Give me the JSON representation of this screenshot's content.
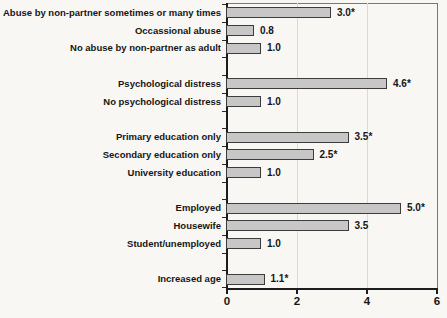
{
  "figure": {
    "kind": "scanned statistical figure",
    "background": "#f8f7f4"
  },
  "chart_data": {
    "type": "bar",
    "orientation": "horizontal",
    "title": "",
    "xlabel": "",
    "ylabel": "",
    "xlim": [
      0,
      6
    ],
    "xticks": [
      0,
      2,
      4,
      6
    ],
    "xtick_labels": [
      "0",
      "2",
      "4",
      "6"
    ],
    "grid": "vertical gridlines at 2 and 4",
    "legend": "none",
    "categories": [
      "Abuse by non-partner sometimes or many times",
      "Occassional abuse",
      "No abuse by non-partner as adult",
      "Psychological distress",
      "No psychological distress",
      "Primary education only",
      "Secondary education only",
      "University education",
      "Employed",
      "Housewife",
      "Student/unemployed",
      "Increased age"
    ],
    "values": [
      3.0,
      0.8,
      1.0,
      4.6,
      1.0,
      3.5,
      2.5,
      1.0,
      5.0,
      3.5,
      1.0,
      1.1
    ],
    "value_labels": [
      "3.0*",
      "0.8",
      "1.0",
      "4.6*",
      "1.0",
      "3.5*",
      "2.5*",
      "1.0",
      "5.0*",
      "3.5",
      "1.0",
      "1.1*"
    ],
    "group_sizes": [
      3,
      2,
      3,
      3,
      1
    ]
  },
  "colors": {
    "bar_fill": "#c7c7c7",
    "bar_border": "#3c3c3c",
    "axis": "#1d1d1d",
    "plot_border": "#7a7873",
    "gridline": "#dddad3",
    "text": "#161616",
    "background": "#f8f7f4"
  }
}
